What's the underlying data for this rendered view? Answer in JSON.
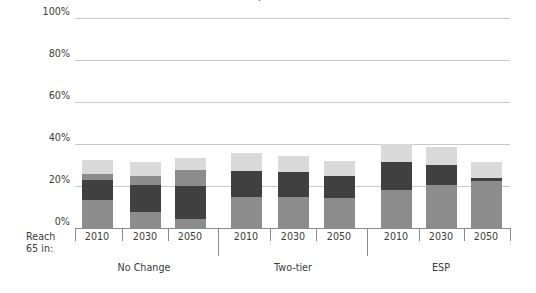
{
  "figure": {
    "title_sliver": "g",
    "ylabel": "Pension income as percentage\nof median earnings at 75",
    "reach_label_line1": "Reach",
    "reach_label_line2": "65 in:"
  },
  "colors": {
    "light": "#d9d9d9",
    "medium": "#8c8c8c",
    "dark": "#404040",
    "gridline": "#c9c9c9",
    "axis": "#8a8a8a",
    "text": "#3b3b3b",
    "background": "#ffffff"
  },
  "chart_data": {
    "type": "bar",
    "title": "",
    "xlabel": "",
    "ylabel": "Pension income as percentage of median earnings at 75",
    "ylim": [
      0,
      100
    ],
    "yticks": [
      "0%",
      "20%",
      "40%",
      "60%",
      "80%",
      "100%"
    ],
    "ytick_values": [
      0,
      20,
      40,
      60,
      80,
      100
    ],
    "grid": true,
    "legend": "none",
    "stacked": true,
    "group_labels": [
      "No Change",
      "Two-tier",
      "ESP"
    ],
    "categories": [
      "2010",
      "2030",
      "2050",
      "2010",
      "2030",
      "2050",
      "2010",
      "2030",
      "2050"
    ],
    "series": [
      {
        "name": "bottom-medium",
        "color": "#8c8c8c",
        "values": [
          13.5,
          7.5,
          4.5,
          15.0,
          15.0,
          14.5,
          18.0,
          20.5,
          22.5
        ]
      },
      {
        "name": "dark",
        "color": "#404040",
        "values": [
          9.5,
          13.0,
          15.5,
          12.0,
          11.5,
          10.5,
          13.5,
          9.5,
          1.5
        ]
      },
      {
        "name": "upper-medium",
        "color": "#8c8c8c",
        "values": [
          2.5,
          4.5,
          7.5,
          0.0,
          0.0,
          0.0,
          0.0,
          0.0,
          0.0
        ]
      },
      {
        "name": "top-light",
        "color": "#d9d9d9",
        "values": [
          7.0,
          6.5,
          6.0,
          8.5,
          8.0,
          7.0,
          8.5,
          8.5,
          7.5
        ]
      }
    ],
    "totals": [
      32.5,
      31.5,
      33.5,
      35.5,
      34.5,
      32.0,
      40.0,
      38.5,
      31.5
    ]
  },
  "bars": [
    {
      "year": "2010",
      "group": "No Change",
      "segments": [
        {
          "name": "bottom-medium",
          "tone": "medium",
          "value": 13.5
        },
        {
          "name": "dark",
          "tone": "dark",
          "value": 9.5
        },
        {
          "name": "upper-medium",
          "tone": "medium",
          "value": 2.5
        },
        {
          "name": "top-light",
          "tone": "light",
          "value": 7.0
        }
      ]
    },
    {
      "year": "2030",
      "group": "No Change",
      "segments": [
        {
          "name": "bottom-medium",
          "tone": "medium",
          "value": 7.5
        },
        {
          "name": "dark",
          "tone": "dark",
          "value": 13.0
        },
        {
          "name": "upper-medium",
          "tone": "medium",
          "value": 4.5
        },
        {
          "name": "top-light",
          "tone": "light",
          "value": 6.5
        }
      ]
    },
    {
      "year": "2050",
      "group": "No Change",
      "segments": [
        {
          "name": "bottom-medium",
          "tone": "medium",
          "value": 4.5
        },
        {
          "name": "dark",
          "tone": "dark",
          "value": 15.5
        },
        {
          "name": "upper-medium",
          "tone": "medium",
          "value": 7.5
        },
        {
          "name": "top-light",
          "tone": "light",
          "value": 6.0
        }
      ]
    },
    {
      "year": "2010",
      "group": "Two-tier",
      "segments": [
        {
          "name": "bottom-medium",
          "tone": "medium",
          "value": 15.0
        },
        {
          "name": "dark",
          "tone": "dark",
          "value": 12.0
        },
        {
          "name": "top-light",
          "tone": "light",
          "value": 8.5
        }
      ]
    },
    {
      "year": "2030",
      "group": "Two-tier",
      "segments": [
        {
          "name": "bottom-medium",
          "tone": "medium",
          "value": 15.0
        },
        {
          "name": "dark",
          "tone": "dark",
          "value": 11.5
        },
        {
          "name": "top-light",
          "tone": "light",
          "value": 8.0
        }
      ]
    },
    {
      "year": "2050",
      "group": "Two-tier",
      "segments": [
        {
          "name": "bottom-medium",
          "tone": "medium",
          "value": 14.5
        },
        {
          "name": "dark",
          "tone": "dark",
          "value": 10.5
        },
        {
          "name": "top-light",
          "tone": "light",
          "value": 7.0
        }
      ]
    },
    {
      "year": "2010",
      "group": "ESP",
      "segments": [
        {
          "name": "bottom-medium",
          "tone": "medium",
          "value": 18.0
        },
        {
          "name": "dark",
          "tone": "dark",
          "value": 13.5
        },
        {
          "name": "top-light",
          "tone": "light",
          "value": 8.5
        }
      ]
    },
    {
      "year": "2030",
      "group": "ESP",
      "segments": [
        {
          "name": "bottom-medium",
          "tone": "medium",
          "value": 20.5
        },
        {
          "name": "dark",
          "tone": "dark",
          "value": 9.5
        },
        {
          "name": "top-light",
          "tone": "light",
          "value": 8.5
        }
      ]
    },
    {
      "year": "2050",
      "group": "ESP",
      "segments": [
        {
          "name": "bottom-medium",
          "tone": "medium",
          "value": 22.5
        },
        {
          "name": "dark",
          "tone": "dark",
          "value": 1.5
        },
        {
          "name": "top-light",
          "tone": "light",
          "value": 7.5
        }
      ]
    }
  ]
}
